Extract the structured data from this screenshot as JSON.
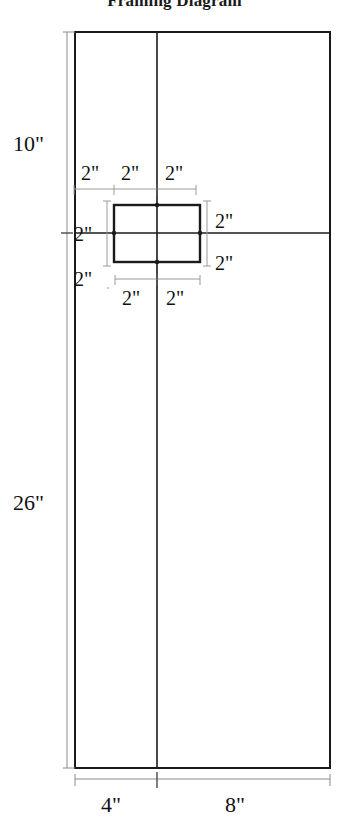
{
  "title": "Framing Diagram",
  "diagram": {
    "type": "engineering-dimension-drawing",
    "units": "inches",
    "outer": {
      "left_column_width": "4\"",
      "right_column_width": "8\"",
      "top_row_height": "10\"",
      "bottom_row_height": "26\""
    },
    "detail_square": {
      "top_labels": [
        "2\"",
        "2\"",
        "2\""
      ],
      "left_labels": [
        "2\"",
        "2\""
      ],
      "right_labels": [
        "2\"",
        "2\""
      ],
      "bottom_labels": [
        "2\"",
        "2\""
      ]
    },
    "labels": {
      "height_top": "10\"",
      "height_bottom": "26\"",
      "width_left": "4\"",
      "width_right": "8\"",
      "top_a": "2\"",
      "top_b": "2\"",
      "top_c": "2\"",
      "left_upper": "2\"",
      "left_lower": "2\"",
      "right_upper": "2\"",
      "right_lower": "2\"",
      "bottom_left": "2\"",
      "bottom_right": "2\""
    },
    "colors": {
      "stroke": "#1a1a1a",
      "thin_stroke": "#555555",
      "dim_stroke": "#8a8a8a",
      "background": "#ffffff",
      "text": "#111111"
    }
  }
}
